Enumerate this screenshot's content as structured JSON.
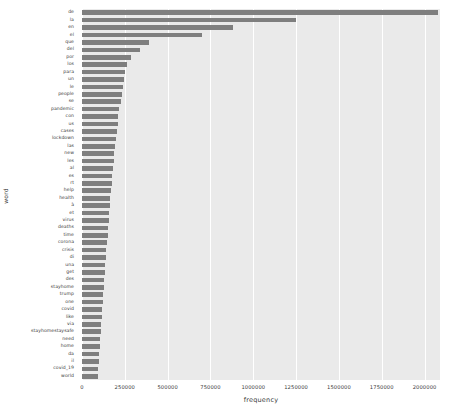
{
  "chart_data": {
    "type": "bar",
    "orientation": "horizontal",
    "title": "",
    "xlabel": "frequency",
    "ylabel": "word",
    "xlim": [
      0,
      2090000
    ],
    "grid": true,
    "legend": false,
    "bar_color": "#7f7f7f",
    "plot_background": "#eaeaea",
    "xticks": [
      0,
      250000,
      500000,
      750000,
      1000000,
      1250000,
      1500000,
      1750000,
      2000000
    ],
    "xticklabels": [
      "0",
      "250000",
      "500000",
      "750000",
      "1000000",
      "1250000",
      "1500000",
      "1750000",
      "2000000"
    ],
    "categories": [
      "de",
      "la",
      "en",
      "el",
      "que",
      "del",
      "por",
      "los",
      "para",
      "un",
      "le",
      "people",
      "se",
      "pandemic",
      "con",
      "us",
      "cases",
      "lockdown",
      "las",
      "new",
      "les",
      "al",
      "es",
      "rt",
      "help",
      "health",
      "à",
      "et",
      "virus",
      "deaths",
      "time",
      "corona",
      "crisis",
      "di",
      "una",
      "get",
      "des",
      "stayhome",
      "trump",
      "one",
      "covid",
      "like",
      "via",
      "stayhomestaysafe",
      "need",
      "home",
      "da",
      "il",
      "covid_19",
      "world"
    ],
    "values": [
      2080000,
      1250000,
      880000,
      700000,
      390000,
      340000,
      285000,
      265000,
      250000,
      243000,
      238000,
      232000,
      225000,
      218000,
      212000,
      208000,
      203000,
      198000,
      193000,
      189000,
      185000,
      181000,
      177000,
      174000,
      170000,
      166000,
      162000,
      159000,
      155000,
      152000,
      149000,
      146000,
      143000,
      140000,
      137000,
      134000,
      131000,
      128000,
      125000,
      122000,
      119000,
      116000,
      113000,
      110000,
      107000,
      104000,
      101000,
      98000,
      95000,
      92000
    ]
  }
}
